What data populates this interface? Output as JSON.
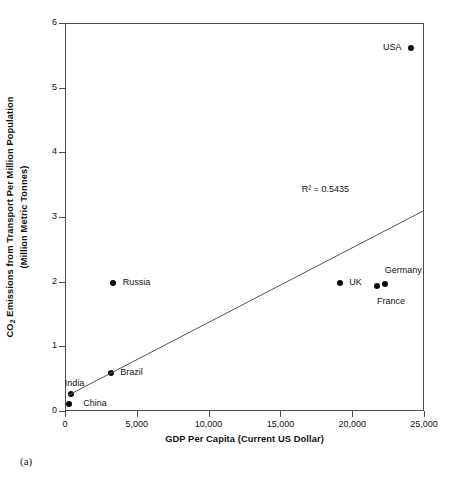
{
  "chart_data": {
    "type": "scatter",
    "title": "",
    "xlabel": "GDP Per Capita (Current US Dollar)",
    "ylabel_line1": "Emissions from Transport Per Million Population",
    "ylabel_line2": "(Million Metric Tonnes)",
    "ylabel_prefix": "CO",
    "ylabel_subscript": "2",
    "xlim": [
      0,
      25000
    ],
    "ylim": [
      0,
      6
    ],
    "xticks": [
      0,
      5000,
      10000,
      15000,
      20000,
      25000
    ],
    "xtick_labels": [
      "0",
      "5,000",
      "10,000",
      "15,000",
      "20,000",
      "25,000"
    ],
    "yticks": [
      0,
      1,
      2,
      3,
      4,
      5,
      6
    ],
    "ytick_labels": [
      "0",
      "1",
      "2",
      "3",
      "4",
      "5",
      "6"
    ],
    "grid": false,
    "legend": "none",
    "points": [
      {
        "label": "China",
        "x": 230,
        "y": 0.13,
        "label_side": "right",
        "label_dx": 14,
        "label_dy": 0
      },
      {
        "label": "India",
        "x": 330,
        "y": 0.28,
        "label_side": "right",
        "label_dx": -6,
        "label_dy": -10
      },
      {
        "label": "Brazil",
        "x": 3150,
        "y": 0.6,
        "label_side": "right",
        "label_dx": 9,
        "label_dy": 0
      },
      {
        "label": "Russia",
        "x": 3250,
        "y": 2.0,
        "label_side": "right",
        "label_dx": 10,
        "label_dy": 0
      },
      {
        "label": "UK",
        "x": 19100,
        "y": 2.0,
        "label_side": "right",
        "label_dx": 9,
        "label_dy": 0
      },
      {
        "label": "France",
        "x": 21650,
        "y": 1.95,
        "label_side": "right",
        "label_dx": 0,
        "label_dy": 16
      },
      {
        "label": "Germany",
        "x": 22200,
        "y": 1.98,
        "label_side": "right",
        "label_dx": 0,
        "label_dy": -13
      },
      {
        "label": "USA",
        "x": 24000,
        "y": 5.63,
        "label_side": "left",
        "label_dx": -9,
        "label_dy": 0
      }
    ],
    "trendline": {
      "x_start": 200,
      "y_start": 0.24,
      "x_end": 25000,
      "y_end": 3.1
    },
    "annotations": [
      {
        "name": "r-squared",
        "text": "R² = 0.5435",
        "x": 21500,
        "y": 3.4
      }
    ]
  },
  "caption": "(a)",
  "colors": {
    "axis": "#4d4d4d",
    "marker": "#0a0a0a",
    "trendline": "#555555",
    "text": "#111111"
  }
}
